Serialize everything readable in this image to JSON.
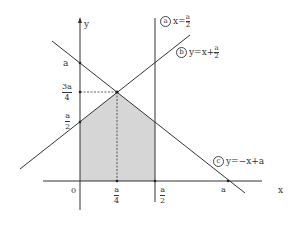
{
  "axes": {
    "x_label": "x",
    "y_label": "y",
    "origin_label": "0"
  },
  "y_ticks": [
    {
      "label": "a"
    },
    {
      "num": "3a",
      "den": "4"
    },
    {
      "num": "a",
      "den": "2"
    }
  ],
  "x_ticks": [
    {
      "num": "a",
      "den": "4"
    },
    {
      "num": "a",
      "den": "2"
    },
    {
      "label": "a"
    }
  ],
  "lines": [
    {
      "marker": "a",
      "eq_prefix": "x=",
      "num": "a",
      "den": "2"
    },
    {
      "marker": "b",
      "eq_prefix": "y=x+",
      "num": "a",
      "den": "2"
    },
    {
      "marker": "c",
      "equation": "y=−x+a"
    }
  ],
  "colors": {
    "shade": "#d6d6d6",
    "line": "#333333"
  }
}
